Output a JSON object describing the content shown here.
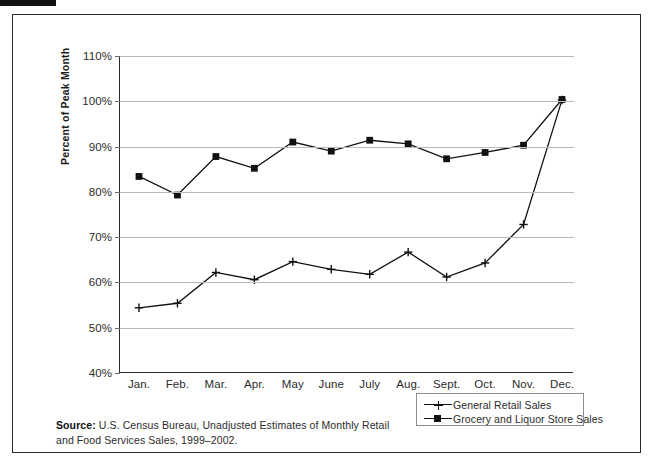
{
  "figure": {
    "source_label": "Source:",
    "source_text": "U.S. Census Bureau, Unadjusted Estimates of Monthly Retail and Food Services Sales, 1999–2002."
  },
  "chart_data": {
    "type": "line",
    "title": "",
    "xlabel": "",
    "ylabel": "Percent of Peak Month",
    "categories": [
      "Jan.",
      "Feb.",
      "Mar.",
      "Apr.",
      "May",
      "June",
      "July",
      "Aug.",
      "Sept.",
      "Oct.",
      "Nov.",
      "Dec."
    ],
    "ytick_labels": [
      "110%",
      "100%",
      "90%",
      "80%",
      "70%",
      "60%",
      "50%",
      "40%"
    ],
    "ytick_values": [
      110,
      100,
      90,
      80,
      70,
      60,
      50,
      40
    ],
    "ylim": [
      40,
      110
    ],
    "grid": "horizontal",
    "legend_position": "bottom-right",
    "series": [
      {
        "name": "General Retail Sales",
        "marker": "plus",
        "color": "#111111",
        "values": [
          54.4,
          55.4,
          62.2,
          60.6,
          64.6,
          62.9,
          61.8,
          66.7,
          61.2,
          64.3,
          72.8,
          100.3
        ]
      },
      {
        "name": "Grocery and Liquor Store Sales",
        "marker": "square",
        "color": "#111111",
        "values": [
          83.4,
          79.3,
          87.8,
          85.2,
          91.0,
          89.0,
          91.4,
          90.6,
          87.3,
          88.7,
          90.3,
          100.4
        ]
      }
    ]
  }
}
